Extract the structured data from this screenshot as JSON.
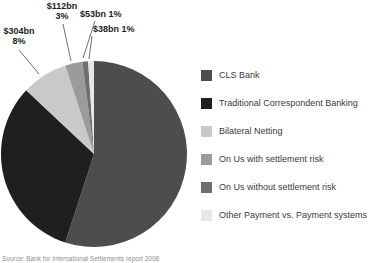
{
  "chart_data": {
    "type": "pie",
    "title": "",
    "legend_position": "right",
    "series": [
      {
        "name": "CLS Bank",
        "percent": 55,
        "amount": null,
        "color": "#4d4d4f"
      },
      {
        "name": "Traditional Correspondent Banking",
        "percent": 32,
        "amount": null,
        "color": "#1f1f1f"
      },
      {
        "name": "Bilateral Netting",
        "percent": 8,
        "amount": "$304bn",
        "color": "#c9c9c9"
      },
      {
        "name": "On Us with settlement risk",
        "percent": 3,
        "amount": "$112bn",
        "color": "#9b9b9b"
      },
      {
        "name": "On Us without settlement risk",
        "percent": 1,
        "amount": "$53bn",
        "color": "#6e6e6e"
      },
      {
        "name": "Other Payment vs. Payment systems",
        "percent": 1,
        "amount": "$38bn",
        "color": "#e7e7e7"
      }
    ]
  },
  "callouts": [
    {
      "line1": "$304bn",
      "line2": "8%"
    },
    {
      "line1": "$112bn",
      "line2": "3%"
    },
    {
      "line1": "$53bn 1%",
      "line2": ""
    },
    {
      "line1": "$38bn 1%",
      "line2": ""
    }
  ],
  "source_note": "Source: Bank for International Settlements report 2008"
}
